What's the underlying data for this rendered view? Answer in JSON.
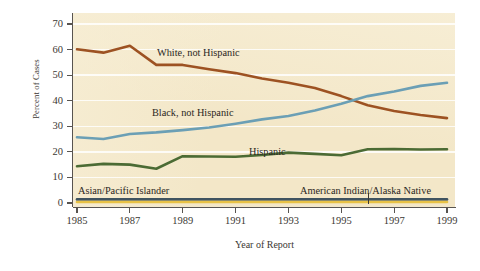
{
  "chart_data": {
    "type": "line",
    "title": "",
    "xlabel": "Year of Report",
    "ylabel": "Percent of Cases",
    "xlim": [
      1985,
      1999
    ],
    "ylim": [
      0,
      70
    ],
    "yticks": [
      0,
      10,
      20,
      30,
      40,
      50,
      60,
      70
    ],
    "xticks": [
      1985,
      1987,
      1989,
      1991,
      1993,
      1995,
      1997,
      1999
    ],
    "xtick_labels": [
      "1985",
      "1987",
      "1989",
      "1991",
      "1993",
      "1995",
      "1997",
      "1999"
    ],
    "ytick_labels": [
      "0",
      "10",
      "20",
      "30",
      "40",
      "50",
      "60",
      "70"
    ],
    "grid": "horizontal-white",
    "legend_position": "inline-annotations",
    "x": [
      1985,
      1986,
      1987,
      1988,
      1989,
      1990,
      1991,
      1992,
      1993,
      1994,
      1995,
      1996,
      1997,
      1998,
      1999
    ],
    "series": [
      {
        "name": "White, not Hispanic",
        "color": "#9d5222",
        "values": [
          60.1,
          58.8,
          61.5,
          54.0,
          54.0,
          52.3,
          50.8,
          48.7,
          47.0,
          45.0,
          41.8,
          38.2,
          36.0,
          34.4,
          33.2
        ]
      },
      {
        "name": "Black, not Hispanic",
        "color": "#6b9fb5",
        "values": [
          25.7,
          25.0,
          27.0,
          27.6,
          28.5,
          29.5,
          31.0,
          32.7,
          34.0,
          36.2,
          38.8,
          41.8,
          43.6,
          45.8,
          47.0
        ]
      },
      {
        "name": "Hispanic",
        "color": "#4b6b34",
        "values": [
          14.4,
          15.3,
          15.0,
          13.4,
          18.3,
          18.2,
          18.1,
          18.8,
          19.7,
          19.2,
          18.7,
          21.0,
          21.1,
          20.9,
          21.0
        ]
      },
      {
        "name": "Asian/Pacific Islander",
        "color": "#3f5360",
        "values": [
          1.4,
          1.4,
          1.4,
          1.4,
          1.4,
          1.4,
          1.4,
          1.4,
          1.4,
          1.4,
          1.4,
          1.4,
          1.4,
          1.4,
          1.4
        ]
      },
      {
        "name": "American Indian/Alaska Native",
        "color": "#e8c246",
        "values": [
          0.4,
          0.4,
          0.4,
          0.4,
          0.4,
          0.4,
          0.4,
          0.4,
          0.4,
          0.4,
          0.4,
          0.4,
          0.4,
          0.4,
          0.4
        ]
      }
    ],
    "annotations": [
      {
        "text": "White, not Hispanic",
        "x_px": 157,
        "y_px": 48
      },
      {
        "text": "Black, not Hispanic",
        "x_px": 152,
        "y_px": 108
      },
      {
        "text": "Hispanic",
        "x_px": 249,
        "y_px": 147
      },
      {
        "text": "Asian/Pacific Islander",
        "x_px": 78,
        "y_px": 186
      },
      {
        "text": "American Indian/Alaska Native",
        "x_px": 300,
        "y_px": 186
      }
    ],
    "colors": {
      "panel_background": "#f3e7c8",
      "figure_background": "#ffffff",
      "axis": "#585450",
      "gridline": "#ffffff",
      "text": "#3b3733"
    }
  }
}
